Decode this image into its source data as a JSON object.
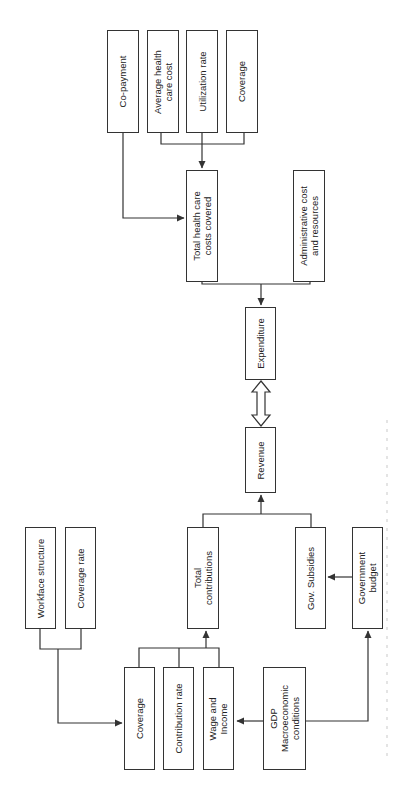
{
  "diagram": {
    "type": "flowchart",
    "orientation": "rotated-90-ccw",
    "nodes": {
      "co_payment": "Co-payment",
      "average_health_care_cost": "Average health\ncare cost",
      "utilization_rate": "Utilization rate",
      "coverage_top": "Coverage",
      "total_health_care_costs": "Total health care\ncosts covered",
      "administrative_cost": "Administrative cost\nand resources",
      "expenditure": "Expenditure",
      "revenue": "Revenue",
      "total_contributions": "Total\ncontributions",
      "gov_subsidies": "Gov. Subsidies",
      "government_budget": "Government\nbudget",
      "workface_structure": "Workface structure",
      "coverage_rate": "Coverage rate",
      "coverage_bottom": "Coverage",
      "contribution_rate": "Contribution rate",
      "wage_and_income": "Wage and\nIncome",
      "gdp": "GDP\nMacroeconomic\nconditions"
    },
    "edges": [
      {
        "from": [
          "Average health care cost",
          "Utilization rate",
          "Coverage"
        ],
        "to": "Total health care costs covered"
      },
      {
        "from": "Co-payment",
        "to": "Total health care costs covered"
      },
      {
        "from": [
          "Total health care costs covered",
          "Administrative cost and resources"
        ],
        "to": "Expenditure"
      },
      {
        "from": "Expenditure",
        "to": "Revenue",
        "bidirectional": true
      },
      {
        "from": [
          "Total contributions",
          "Gov. Subsidies"
        ],
        "to": "Revenue"
      },
      {
        "from": "Government budget",
        "to": "Gov. Subsidies"
      },
      {
        "from": [
          "Coverage",
          "Contribution rate",
          "Wage and Income"
        ],
        "to": "Total contributions"
      },
      {
        "from": [
          "Workface structure",
          "Coverage rate"
        ],
        "to": "Coverage"
      },
      {
        "from": "GDP Macroeconomic conditions",
        "to": "Wage and Income"
      },
      {
        "from": "GDP Macroeconomic conditions",
        "to": "Government budget"
      }
    ],
    "colors": {
      "stroke": "#333333",
      "text": "#222222",
      "background": "#ffffff"
    }
  }
}
